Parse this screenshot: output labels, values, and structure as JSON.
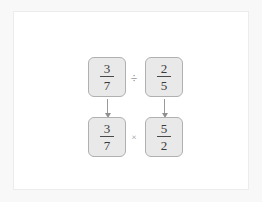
{
  "colors": {
    "page_background": "#f8f8f8",
    "panel_background": "#ffffff",
    "panel_border": "#ececec",
    "box_fill": "#e9e9e9",
    "box_border": "#b0b0b0",
    "text": "#3a3a3a",
    "operator_divide": "#666666",
    "operator_multiply": "#8e8e8e",
    "arrow": "#9a9a9a"
  },
  "diagram": {
    "rows": [
      {
        "name": "division-expression",
        "operator": "÷",
        "operator_name": "division-sign",
        "left": {
          "numerator": "3",
          "denominator": "7"
        },
        "right": {
          "numerator": "2",
          "denominator": "5"
        }
      },
      {
        "name": "multiplication-expression",
        "operator": "×",
        "operator_name": "multiplication-sign",
        "left": {
          "numerator": "3",
          "denominator": "7"
        },
        "right": {
          "numerator": "5",
          "denominator": "2"
        }
      }
    ],
    "arrows": [
      {
        "name": "arrow-left-column",
        "direction": "down"
      },
      {
        "name": "arrow-right-column",
        "direction": "down"
      }
    ]
  }
}
